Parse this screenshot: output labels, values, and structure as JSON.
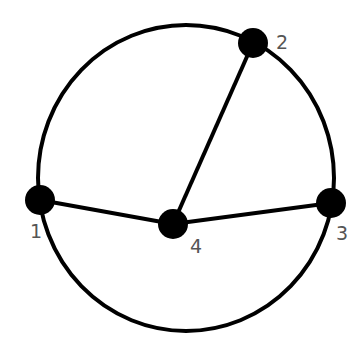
{
  "diagram": {
    "type": "graph",
    "colors": {
      "stroke": "#000000",
      "node": "#000000",
      "label": "#555555",
      "background": "#ffffff"
    },
    "outer_circle": {
      "cx": 186,
      "cy": 178,
      "rx": 148,
      "ry": 153
    },
    "nodes": [
      {
        "id": "1",
        "label": "1",
        "x": 40,
        "y": 200,
        "label_x": 30,
        "label_y": 238
      },
      {
        "id": "2",
        "label": "2",
        "x": 253,
        "y": 43,
        "label_x": 276,
        "label_y": 49
      },
      {
        "id": "3",
        "label": "3",
        "x": 331,
        "y": 203,
        "label_x": 336,
        "label_y": 240
      },
      {
        "id": "4",
        "label": "4",
        "x": 173,
        "y": 224,
        "label_x": 190,
        "label_y": 253
      }
    ],
    "edges": [
      {
        "from": "1",
        "to": "4",
        "kind": "straight"
      },
      {
        "from": "2",
        "to": "4",
        "kind": "straight"
      },
      {
        "from": "3",
        "to": "4",
        "kind": "straight"
      },
      {
        "from": "1",
        "to": "2",
        "kind": "arc"
      },
      {
        "from": "2",
        "to": "3",
        "kind": "arc"
      },
      {
        "from": "3",
        "to": "1",
        "kind": "arc"
      }
    ]
  }
}
